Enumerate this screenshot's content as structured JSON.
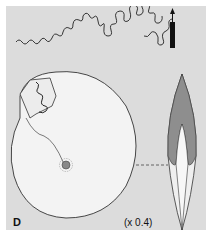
{
  "figure": {
    "panel_label": "D",
    "scale_text": "(x 0.4)",
    "elements": [
      {
        "name": "suture-line",
        "description": "ammonitic suture pattern with venter arrow"
      },
      {
        "name": "shell-lateral-view",
        "description": "coiled ammonite shell, side view, with suture exposed"
      },
      {
        "name": "shell-apertural-view",
        "description": "ammonite shell cross-section, oxycone profile"
      }
    ],
    "colors": {
      "background": "#dcdcdc",
      "shell": "#f2f2f2",
      "shading": "#8a8a8a",
      "line": "#222222"
    }
  }
}
